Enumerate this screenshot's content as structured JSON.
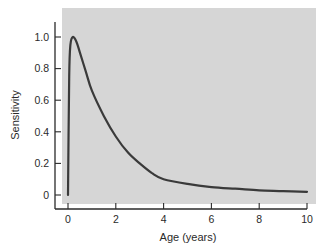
{
  "chart_data": {
    "type": "line",
    "title": "",
    "xlabel": "Age (years)",
    "ylabel": "Sensitivity",
    "xlim": [
      0,
      10
    ],
    "ylim": [
      0,
      1.0
    ],
    "x_ticks": [
      0,
      2,
      4,
      6,
      8,
      10
    ],
    "x_tick_labels": [
      "0",
      "2",
      "4",
      "6",
      "8",
      "10"
    ],
    "y_ticks": [
      0,
      0.2,
      0.4,
      0.6,
      0.8,
      1.0
    ],
    "y_tick_labels": [
      "0",
      "0.2",
      "0.4",
      "0.6",
      "0.8",
      "1.0"
    ],
    "grid": false,
    "legend": null,
    "background": "#d6d6d6",
    "line_color": "#3a3a3a",
    "series": [
      {
        "name": "Sensitivity",
        "x": [
          0,
          0.05,
          0.1,
          0.2,
          0.35,
          0.5,
          0.75,
          1,
          1.5,
          2,
          2.5,
          3,
          3.5,
          4,
          5,
          6,
          7,
          8,
          9,
          10
        ],
        "values": [
          0.0,
          0.75,
          0.95,
          1.0,
          0.97,
          0.9,
          0.78,
          0.66,
          0.5,
          0.37,
          0.27,
          0.2,
          0.14,
          0.1,
          0.07,
          0.05,
          0.04,
          0.03,
          0.025,
          0.02
        ]
      }
    ]
  }
}
